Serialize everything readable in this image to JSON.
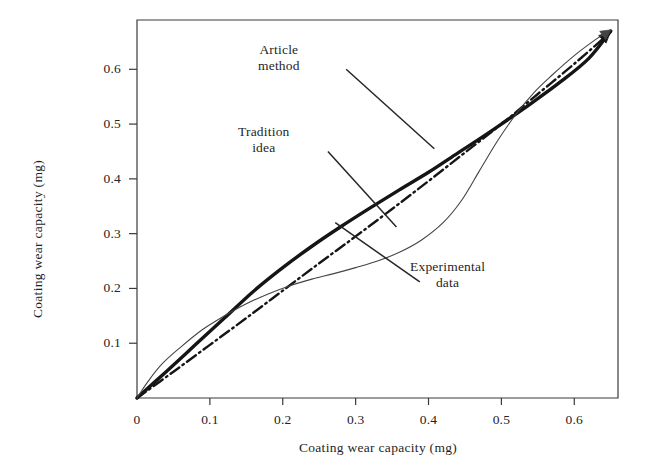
{
  "figure": {
    "background": "#ffffff",
    "ink_color": "#1f1f1f"
  },
  "chart_data": {
    "type": "line",
    "title": "",
    "xlabel": "Coating wear capacity (mg)",
    "ylabel": "Coating wear capacity (mg)",
    "xlim": [
      0,
      0.66
    ],
    "ylim": [
      0,
      0.69
    ],
    "grid": false,
    "legend_position": "inline-annotations",
    "x_ticks": [
      0,
      0.1,
      0.2,
      0.3,
      0.4,
      0.5,
      0.6
    ],
    "x_tick_labels": [
      "0",
      "0.1",
      "0.2",
      "0.3",
      "0.4",
      "0.5",
      "0.6"
    ],
    "y_ticks": [
      0.1,
      0.2,
      0.3,
      0.4,
      0.5,
      0.6
    ],
    "y_tick_labels": [
      "0.1",
      "0.2",
      "0.3",
      "0.4",
      "0.5",
      "0.6"
    ],
    "series": [
      {
        "name": "Article method",
        "style": "thick-solid",
        "color": "#151515",
        "width": 3.4,
        "x": [
          0.0,
          0.04,
          0.08,
          0.12,
          0.16,
          0.2,
          0.24,
          0.28,
          0.32,
          0.36,
          0.4,
          0.44,
          0.47,
          0.5,
          0.54,
          0.58,
          0.62,
          0.65
        ],
        "y": [
          0.0,
          0.048,
          0.097,
          0.146,
          0.195,
          0.238,
          0.277,
          0.313,
          0.347,
          0.38,
          0.412,
          0.447,
          0.473,
          0.5,
          0.537,
          0.576,
          0.62,
          0.67
        ]
      },
      {
        "name": "Tradition idea",
        "style": "dash-dot",
        "color": "#151515",
        "width": 2.4,
        "x": [
          0.0,
          0.05,
          0.1,
          0.15,
          0.2,
          0.25,
          0.3,
          0.35,
          0.4,
          0.45,
          0.5,
          0.55,
          0.6,
          0.65
        ],
        "y": [
          0.0,
          0.048,
          0.097,
          0.146,
          0.196,
          0.246,
          0.295,
          0.345,
          0.396,
          0.448,
          0.5,
          0.555,
          0.61,
          0.668
        ]
      },
      {
        "name": "Experimental data",
        "style": "thin-solid",
        "color": "#444444",
        "width": 1.1,
        "x": [
          0.0,
          0.015,
          0.035,
          0.06,
          0.09,
          0.12,
          0.15,
          0.18,
          0.21,
          0.24,
          0.27,
          0.3,
          0.33,
          0.36,
          0.39,
          0.42,
          0.445,
          0.47,
          0.495,
          0.52,
          0.545,
          0.57,
          0.6,
          0.63,
          0.65
        ],
        "y": [
          0.0,
          0.03,
          0.063,
          0.093,
          0.125,
          0.15,
          0.172,
          0.19,
          0.205,
          0.217,
          0.227,
          0.238,
          0.25,
          0.266,
          0.288,
          0.32,
          0.36,
          0.415,
          0.47,
          0.518,
          0.558,
          0.59,
          0.625,
          0.655,
          0.672
        ]
      }
    ],
    "annotations": [
      {
        "id": "article-method",
        "lines": [
          "Article",
          "method"
        ],
        "leader_from": [
          0.287,
          0.6
        ],
        "leader_to": [
          0.408,
          0.455
        ]
      },
      {
        "id": "tradition-idea",
        "lines": [
          "Tradition",
          "idea"
        ],
        "leader_from": [
          0.262,
          0.45
        ],
        "leader_to": [
          0.356,
          0.312
        ]
      },
      {
        "id": "experimental-data",
        "lines": [
          "Experimental",
          "data"
        ],
        "leader_from": [
          0.388,
          0.212
        ],
        "leader_to": [
          0.272,
          0.32
        ]
      }
    ]
  },
  "axes": {
    "x_title": "Coating wear capacity (mg)",
    "y_title": "Coating wear capacity (mg)",
    "x_labels": [
      "0",
      "0.1",
      "0.2",
      "0.3",
      "0.4",
      "0.5",
      "0.6"
    ],
    "y_labels": [
      "0.1",
      "0.2",
      "0.3",
      "0.4",
      "0.5",
      "0.6"
    ]
  },
  "annotation_text": {
    "article_line1": "Article",
    "article_line2": "method",
    "tradition_line1": "Tradition",
    "tradition_line2": "idea",
    "experimental_line1": "Experimental",
    "experimental_line2": "data"
  }
}
